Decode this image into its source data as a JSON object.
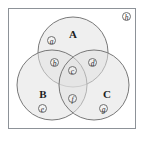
{
  "figure": {
    "type": "venn-diagram-three-set",
    "frame": {
      "border_color": "#8d9298",
      "background": "#ffffff"
    },
    "circle_style": {
      "fill": "#e2e2e2",
      "stroke": "#6a6a6a",
      "fill_opacity": 0.55
    },
    "sets": [
      {
        "id": "A",
        "label": "A",
        "position": "top"
      },
      {
        "id": "B",
        "label": "B",
        "position": "bottom-left"
      },
      {
        "id": "C",
        "label": "C",
        "position": "bottom-right"
      }
    ],
    "regions": [
      {
        "id": "a",
        "label": "a",
        "meaning": "A only"
      },
      {
        "id": "b",
        "label": "b",
        "meaning": "A and B only"
      },
      {
        "id": "c",
        "label": "c",
        "meaning": "A and B and C"
      },
      {
        "id": "d",
        "label": "d",
        "meaning": "A and C only"
      },
      {
        "id": "e",
        "label": "e",
        "meaning": "B only"
      },
      {
        "id": "f",
        "label": "f",
        "meaning": "B and C only"
      },
      {
        "id": "g",
        "label": "g",
        "meaning": "C only"
      },
      {
        "id": "h",
        "label": "h",
        "meaning": "outside all sets"
      }
    ]
  }
}
